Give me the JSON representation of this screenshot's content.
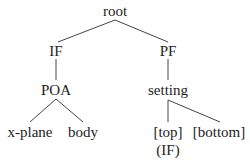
{
  "tree": {
    "root": {
      "label": "root"
    },
    "if": {
      "label": "IF"
    },
    "pf": {
      "label": "PF"
    },
    "poa": {
      "label": "POA"
    },
    "setting": {
      "label": "setting"
    },
    "xplane": {
      "label": "x-plane"
    },
    "body": {
      "label": "body"
    },
    "top": {
      "label": "[top]"
    },
    "bottom": {
      "label": "[bottom]"
    },
    "top_annotation": {
      "label": "(IF)"
    }
  },
  "colors": {
    "line": "#444444",
    "text": "#222222"
  }
}
